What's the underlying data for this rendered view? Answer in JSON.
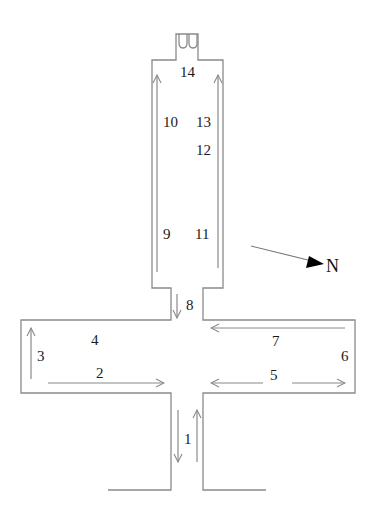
{
  "diagram": {
    "type": "floor-plan route map",
    "compass": {
      "label": "N",
      "arrow_direction": "east-southeast"
    },
    "labels": {
      "l1": "1",
      "l2": "2",
      "l3": "3",
      "l4": "4",
      "l5": "5",
      "l6": "6",
      "l7": "7",
      "l8": "8",
      "l9": "9",
      "l10": "10",
      "l11": "11",
      "l12": "12",
      "l13": "13",
      "l14": "14"
    },
    "colors": {
      "walls": "#8a8a8a",
      "arrows": "#8a8a8a",
      "text": "#1a1a1a",
      "north_arrow": "#000000"
    }
  }
}
